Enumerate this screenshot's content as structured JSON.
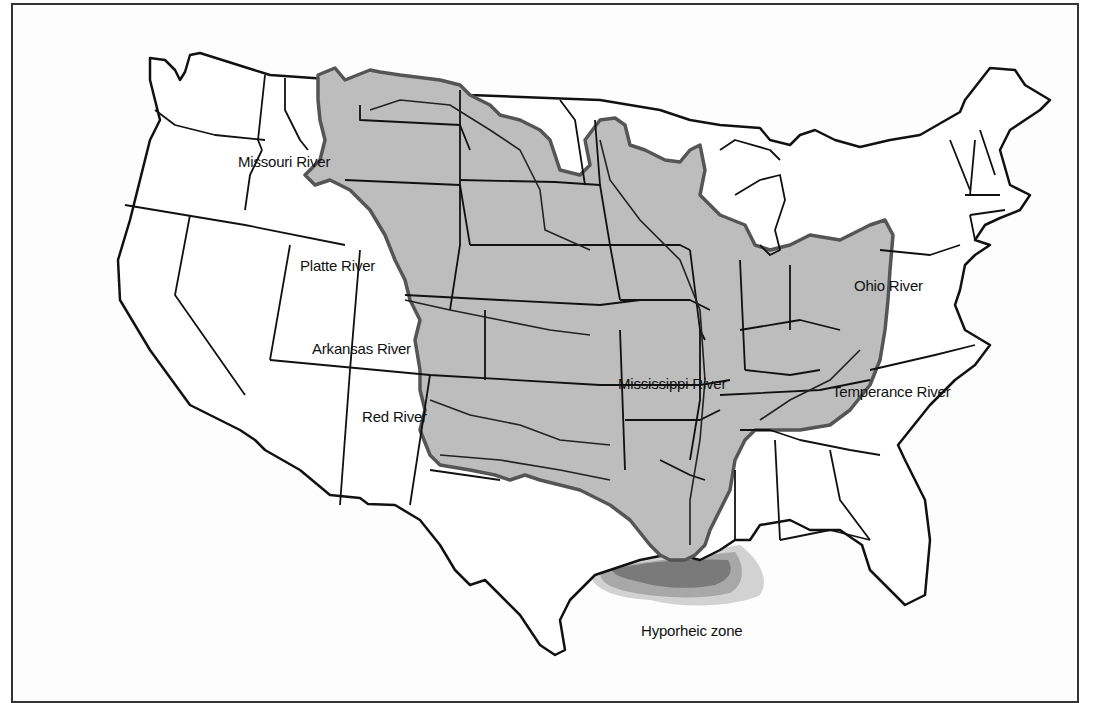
{
  "map": {
    "subject": "Mississippi River drainage basin, contiguous United States",
    "colors": {
      "basin_fill": "#bdbdbd",
      "basin_outline": "#555555",
      "state_lines": "#111111",
      "background": "#fdfdfd",
      "hyporheic_dark": "#7a7a7a",
      "hyporheic_mid": "#a8a8a8",
      "hyporheic_light": "#d2d2d2"
    },
    "labels": {
      "missouri": "Missouri River",
      "platte": "Platte River",
      "arkansas": "Arkansas River",
      "red": "Red River",
      "mississippi": "Mississippi River",
      "ohio": "Ohio River",
      "temperance": "Temperance River",
      "hyporheic": "Hyporheic zone"
    }
  }
}
